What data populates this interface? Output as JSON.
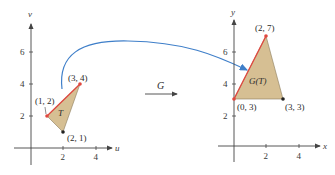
{
  "colors": {
    "axis": "#444444",
    "fill": "#d6bf93",
    "edge_red": "#e0473f",
    "arrow_blue": "#3f7fc9",
    "text": "#2a2a2a"
  },
  "left_plot": {
    "x_axis_label": "u",
    "y_axis_label": "v",
    "x_ticks": [
      "2",
      "4"
    ],
    "y_ticks": [
      "2",
      "4",
      "6"
    ],
    "region_label": "T",
    "vertices": [
      {
        "label": "(1, 2)",
        "u": 1,
        "v": 2
      },
      {
        "label": "(3, 4)",
        "u": 3,
        "v": 4
      },
      {
        "label": "(2, 1)",
        "u": 2,
        "v": 1
      }
    ]
  },
  "right_plot": {
    "x_axis_label": "x",
    "y_axis_label": "y",
    "x_ticks": [
      "2",
      "4"
    ],
    "y_ticks": [
      "2",
      "4",
      "6"
    ],
    "region_label": "G(T)",
    "vertices": [
      {
        "label": "(2, 7)",
        "x": 2,
        "y": 7
      },
      {
        "label": "(0, 3)",
        "x": 0,
        "y": 3
      },
      {
        "label": "(3, 3)",
        "x": 3,
        "y": 3
      }
    ]
  },
  "transform": {
    "label": "G"
  }
}
